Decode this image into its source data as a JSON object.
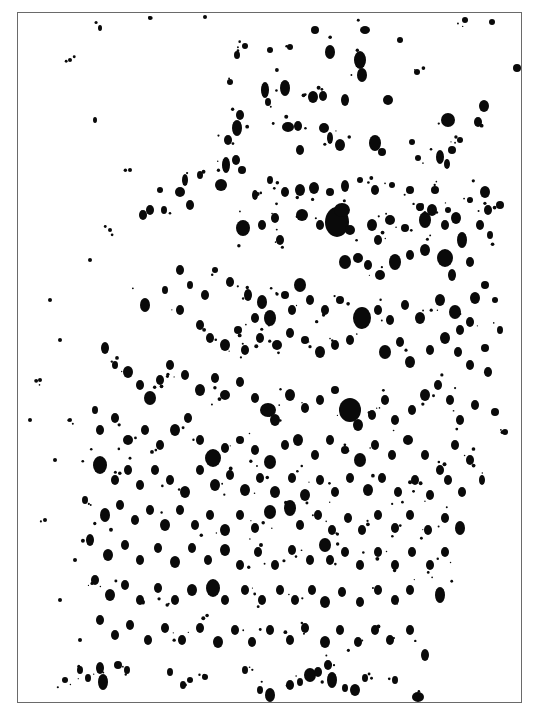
{
  "image": {
    "description": "Black ink splatter texture on white paper within a thin gray rectangular frame",
    "background_color": "#ffffff",
    "ink_color": "#0a0a0a",
    "frame_color": "#6a6a6a",
    "frame": {
      "x": 17,
      "y": 12,
      "width": 505,
      "height": 691
    }
  },
  "blobs": [
    [
      237,
      55,
      3,
      4
    ],
    [
      330,
      52,
      5,
      7
    ],
    [
      360,
      60,
      6,
      9
    ],
    [
      362,
      75,
      5,
      7
    ],
    [
      285,
      88,
      5,
      8
    ],
    [
      313,
      97,
      5,
      6
    ],
    [
      323,
      96,
      4,
      5
    ],
    [
      345,
      100,
      4,
      6
    ],
    [
      388,
      100,
      5,
      5
    ],
    [
      417,
      72,
      3,
      3
    ],
    [
      448,
      120,
      7,
      7
    ],
    [
      452,
      150,
      4,
      4
    ],
    [
      478,
      122,
      4,
      5
    ],
    [
      484,
      106,
      5,
      6
    ],
    [
      517,
      68,
      4,
      4
    ],
    [
      230,
      82,
      3,
      3
    ],
    [
      240,
      115,
      4,
      5
    ],
    [
      228,
      140,
      4,
      5
    ],
    [
      265,
      90,
      4,
      8
    ],
    [
      268,
      102,
      3,
      4
    ],
    [
      288,
      127,
      6,
      5
    ],
    [
      298,
      126,
      4,
      5
    ],
    [
      324,
      128,
      5,
      5
    ],
    [
      330,
      138,
      3,
      6
    ],
    [
      340,
      145,
      5,
      6
    ],
    [
      300,
      150,
      4,
      5
    ],
    [
      375,
      143,
      6,
      8
    ],
    [
      382,
      152,
      4,
      4
    ],
    [
      412,
      142,
      3,
      3
    ],
    [
      418,
      158,
      3,
      3
    ],
    [
      440,
      157,
      4,
      7
    ],
    [
      447,
      164,
      3,
      5
    ],
    [
      460,
      140,
      3,
      3
    ],
    [
      237,
      128,
      5,
      8
    ],
    [
      236,
      160,
      4,
      5
    ],
    [
      242,
      170,
      4,
      4
    ],
    [
      226,
      165,
      4,
      8
    ],
    [
      221,
      185,
      6,
      6
    ],
    [
      200,
      175,
      3,
      4
    ],
    [
      185,
      180,
      3,
      6
    ],
    [
      180,
      192,
      5,
      5
    ],
    [
      190,
      205,
      4,
      5
    ],
    [
      160,
      190,
      3,
      3
    ],
    [
      150,
      210,
      4,
      5
    ],
    [
      143,
      215,
      4,
      5
    ],
    [
      164,
      210,
      3,
      4
    ],
    [
      255,
      195,
      3,
      5
    ],
    [
      270,
      180,
      3,
      4
    ],
    [
      285,
      192,
      4,
      5
    ],
    [
      300,
      190,
      5,
      6
    ],
    [
      314,
      188,
      5,
      6
    ],
    [
      330,
      192,
      4,
      4
    ],
    [
      345,
      186,
      4,
      6
    ],
    [
      360,
      180,
      3,
      3
    ],
    [
      375,
      190,
      4,
      5
    ],
    [
      392,
      185,
      3,
      3
    ],
    [
      410,
      190,
      4,
      4
    ],
    [
      420,
      207,
      4,
      4
    ],
    [
      435,
      190,
      4,
      4
    ],
    [
      448,
      210,
      3,
      3
    ],
    [
      470,
      200,
      3,
      3
    ],
    [
      485,
      192,
      5,
      6
    ],
    [
      488,
      210,
      4,
      5
    ],
    [
      500,
      205,
      4,
      4
    ],
    [
      243,
      228,
      7,
      8
    ],
    [
      262,
      225,
      4,
      5
    ],
    [
      275,
      218,
      4,
      5
    ],
    [
      280,
      240,
      4,
      5
    ],
    [
      302,
      215,
      6,
      6
    ],
    [
      320,
      225,
      4,
      5
    ],
    [
      337,
      222,
      12,
      15
    ],
    [
      342,
      210,
      8,
      7
    ],
    [
      350,
      230,
      5,
      5
    ],
    [
      372,
      225,
      5,
      6
    ],
    [
      378,
      240,
      4,
      5
    ],
    [
      390,
      220,
      5,
      5
    ],
    [
      405,
      228,
      4,
      4
    ],
    [
      425,
      220,
      6,
      8
    ],
    [
      432,
      210,
      5,
      6
    ],
    [
      445,
      225,
      4,
      5
    ],
    [
      456,
      218,
      5,
      6
    ],
    [
      462,
      240,
      5,
      8
    ],
    [
      480,
      225,
      4,
      5
    ],
    [
      490,
      235,
      3,
      4
    ],
    [
      345,
      262,
      6,
      7
    ],
    [
      358,
      258,
      5,
      5
    ],
    [
      368,
      265,
      4,
      5
    ],
    [
      380,
      275,
      5,
      5
    ],
    [
      395,
      262,
      6,
      8
    ],
    [
      410,
      255,
      4,
      5
    ],
    [
      425,
      250,
      5,
      6
    ],
    [
      445,
      258,
      8,
      9
    ],
    [
      452,
      275,
      4,
      6
    ],
    [
      470,
      262,
      4,
      5
    ],
    [
      485,
      285,
      4,
      4
    ],
    [
      475,
      298,
      5,
      6
    ],
    [
      495,
      300,
      3,
      3
    ],
    [
      500,
      330,
      3,
      4
    ],
    [
      485,
      348,
      4,
      4
    ],
    [
      180,
      270,
      4,
      5
    ],
    [
      190,
      285,
      3,
      4
    ],
    [
      205,
      295,
      4,
      5
    ],
    [
      215,
      270,
      3,
      3
    ],
    [
      230,
      282,
      4,
      5
    ],
    [
      248,
      295,
      4,
      6
    ],
    [
      262,
      302,
      5,
      7
    ],
    [
      270,
      318,
      6,
      8
    ],
    [
      255,
      318,
      4,
      5
    ],
    [
      285,
      295,
      4,
      4
    ],
    [
      300,
      285,
      6,
      7
    ],
    [
      292,
      310,
      4,
      5
    ],
    [
      310,
      300,
      4,
      5
    ],
    [
      325,
      310,
      4,
      5
    ],
    [
      340,
      300,
      4,
      4
    ],
    [
      362,
      318,
      9,
      11
    ],
    [
      378,
      310,
      4,
      5
    ],
    [
      390,
      320,
      4,
      5
    ],
    [
      405,
      305,
      4,
      5
    ],
    [
      420,
      318,
      5,
      6
    ],
    [
      440,
      300,
      5,
      6
    ],
    [
      455,
      312,
      6,
      7
    ],
    [
      460,
      330,
      4,
      5
    ],
    [
      470,
      322,
      4,
      5
    ],
    [
      145,
      305,
      5,
      7
    ],
    [
      165,
      290,
      3,
      4
    ],
    [
      180,
      310,
      4,
      5
    ],
    [
      200,
      325,
      4,
      5
    ],
    [
      210,
      338,
      4,
      5
    ],
    [
      225,
      345,
      5,
      6
    ],
    [
      238,
      330,
      4,
      4
    ],
    [
      245,
      350,
      4,
      5
    ],
    [
      260,
      338,
      4,
      5
    ],
    [
      277,
      345,
      5,
      5
    ],
    [
      290,
      333,
      4,
      5
    ],
    [
      305,
      340,
      4,
      4
    ],
    [
      320,
      352,
      5,
      6
    ],
    [
      335,
      345,
      4,
      5
    ],
    [
      350,
      340,
      4,
      5
    ],
    [
      385,
      352,
      6,
      7
    ],
    [
      400,
      342,
      4,
      5
    ],
    [
      410,
      362,
      5,
      6
    ],
    [
      430,
      350,
      4,
      5
    ],
    [
      445,
      338,
      5,
      6
    ],
    [
      458,
      352,
      4,
      5
    ],
    [
      470,
      365,
      4,
      5
    ],
    [
      488,
      372,
      4,
      5
    ],
    [
      105,
      348,
      4,
      6
    ],
    [
      115,
      365,
      3,
      4
    ],
    [
      128,
      372,
      5,
      6
    ],
    [
      140,
      385,
      4,
      5
    ],
    [
      150,
      398,
      6,
      7
    ],
    [
      160,
      380,
      4,
      5
    ],
    [
      170,
      365,
      4,
      5
    ],
    [
      185,
      375,
      4,
      5
    ],
    [
      200,
      390,
      5,
      6
    ],
    [
      215,
      378,
      4,
      5
    ],
    [
      225,
      395,
      5,
      5
    ],
    [
      240,
      382,
      4,
      5
    ],
    [
      255,
      398,
      4,
      5
    ],
    [
      268,
      410,
      8,
      7
    ],
    [
      275,
      420,
      5,
      6
    ],
    [
      290,
      395,
      5,
      6
    ],
    [
      305,
      408,
      4,
      5
    ],
    [
      320,
      400,
      4,
      5
    ],
    [
      335,
      390,
      4,
      4
    ],
    [
      350,
      410,
      11,
      12
    ],
    [
      358,
      425,
      5,
      6
    ],
    [
      372,
      415,
      4,
      5
    ],
    [
      385,
      400,
      4,
      5
    ],
    [
      395,
      420,
      4,
      5
    ],
    [
      412,
      410,
      4,
      5
    ],
    [
      425,
      395,
      5,
      6
    ],
    [
      438,
      385,
      4,
      5
    ],
    [
      450,
      400,
      4,
      5
    ],
    [
      460,
      420,
      4,
      5
    ],
    [
      475,
      405,
      4,
      5
    ],
    [
      495,
      412,
      4,
      4
    ],
    [
      95,
      410,
      3,
      4
    ],
    [
      100,
      430,
      4,
      5
    ],
    [
      115,
      418,
      4,
      5
    ],
    [
      128,
      440,
      5,
      5
    ],
    [
      145,
      430,
      4,
      5
    ],
    [
      160,
      445,
      4,
      5
    ],
    [
      175,
      430,
      5,
      6
    ],
    [
      188,
      418,
      4,
      5
    ],
    [
      200,
      440,
      4,
      5
    ],
    [
      213,
      458,
      8,
      9
    ],
    [
      225,
      448,
      4,
      5
    ],
    [
      240,
      440,
      4,
      4
    ],
    [
      255,
      450,
      4,
      5
    ],
    [
      270,
      462,
      6,
      7
    ],
    [
      285,
      445,
      4,
      5
    ],
    [
      298,
      440,
      5,
      6
    ],
    [
      315,
      455,
      4,
      5
    ],
    [
      330,
      440,
      4,
      5
    ],
    [
      345,
      450,
      4,
      4
    ],
    [
      360,
      460,
      6,
      7
    ],
    [
      375,
      445,
      4,
      5
    ],
    [
      392,
      455,
      4,
      5
    ],
    [
      408,
      440,
      5,
      5
    ],
    [
      425,
      455,
      4,
      5
    ],
    [
      440,
      470,
      4,
      5
    ],
    [
      455,
      445,
      4,
      5
    ],
    [
      470,
      460,
      4,
      5
    ],
    [
      482,
      480,
      3,
      5
    ],
    [
      505,
      432,
      3,
      3
    ],
    [
      100,
      465,
      7,
      9
    ],
    [
      115,
      480,
      4,
      5
    ],
    [
      128,
      470,
      4,
      5
    ],
    [
      140,
      485,
      4,
      5
    ],
    [
      155,
      470,
      4,
      5
    ],
    [
      170,
      480,
      4,
      5
    ],
    [
      185,
      492,
      5,
      6
    ],
    [
      200,
      470,
      4,
      5
    ],
    [
      215,
      485,
      5,
      6
    ],
    [
      230,
      475,
      4,
      5
    ],
    [
      245,
      490,
      5,
      6
    ],
    [
      260,
      478,
      4,
      5
    ],
    [
      275,
      492,
      5,
      6
    ],
    [
      292,
      478,
      4,
      5
    ],
    [
      305,
      495,
      5,
      6
    ],
    [
      320,
      480,
      4,
      5
    ],
    [
      335,
      492,
      4,
      5
    ],
    [
      350,
      478,
      4,
      5
    ],
    [
      368,
      490,
      5,
      6
    ],
    [
      382,
      478,
      4,
      5
    ],
    [
      398,
      492,
      4,
      5
    ],
    [
      415,
      480,
      4,
      5
    ],
    [
      430,
      495,
      4,
      5
    ],
    [
      448,
      480,
      4,
      5
    ],
    [
      462,
      492,
      4,
      5
    ],
    [
      85,
      500,
      3,
      4
    ],
    [
      105,
      515,
      5,
      7
    ],
    [
      120,
      505,
      4,
      5
    ],
    [
      135,
      520,
      4,
      5
    ],
    [
      150,
      510,
      4,
      5
    ],
    [
      165,
      525,
      5,
      6
    ],
    [
      180,
      510,
      4,
      5
    ],
    [
      195,
      525,
      4,
      5
    ],
    [
      210,
      515,
      4,
      5
    ],
    [
      225,
      530,
      5,
      6
    ],
    [
      240,
      515,
      4,
      5
    ],
    [
      255,
      528,
      4,
      5
    ],
    [
      270,
      512,
      6,
      7
    ],
    [
      290,
      508,
      6,
      8
    ],
    [
      300,
      525,
      4,
      5
    ],
    [
      318,
      515,
      4,
      5
    ],
    [
      332,
      530,
      4,
      5
    ],
    [
      348,
      518,
      4,
      5
    ],
    [
      362,
      530,
      4,
      5
    ],
    [
      378,
      515,
      4,
      5
    ],
    [
      395,
      528,
      4,
      5
    ],
    [
      410,
      515,
      4,
      5
    ],
    [
      428,
      530,
      4,
      5
    ],
    [
      445,
      518,
      4,
      5
    ],
    [
      460,
      528,
      5,
      7
    ],
    [
      90,
      540,
      4,
      6
    ],
    [
      108,
      555,
      5,
      6
    ],
    [
      125,
      545,
      4,
      5
    ],
    [
      140,
      560,
      4,
      5
    ],
    [
      158,
      548,
      4,
      5
    ],
    [
      175,
      562,
      5,
      6
    ],
    [
      192,
      548,
      4,
      5
    ],
    [
      208,
      560,
      4,
      5
    ],
    [
      225,
      550,
      5,
      6
    ],
    [
      240,
      565,
      4,
      5
    ],
    [
      258,
      552,
      4,
      5
    ],
    [
      275,
      565,
      4,
      5
    ],
    [
      292,
      550,
      4,
      5
    ],
    [
      310,
      560,
      4,
      5
    ],
    [
      325,
      545,
      6,
      7
    ],
    [
      330,
      560,
      4,
      5
    ],
    [
      345,
      552,
      4,
      5
    ],
    [
      360,
      565,
      4,
      5
    ],
    [
      378,
      552,
      4,
      5
    ],
    [
      395,
      565,
      4,
      5
    ],
    [
      412,
      552,
      4,
      5
    ],
    [
      430,
      565,
      4,
      5
    ],
    [
      445,
      552,
      4,
      5
    ],
    [
      95,
      580,
      4,
      5
    ],
    [
      110,
      595,
      5,
      6
    ],
    [
      125,
      585,
      4,
      5
    ],
    [
      140,
      600,
      4,
      5
    ],
    [
      158,
      588,
      4,
      5
    ],
    [
      175,
      600,
      4,
      5
    ],
    [
      192,
      590,
      5,
      6
    ],
    [
      213,
      588,
      7,
      9
    ],
    [
      225,
      600,
      4,
      5
    ],
    [
      245,
      590,
      4,
      5
    ],
    [
      262,
      600,
      4,
      5
    ],
    [
      280,
      590,
      4,
      5
    ],
    [
      295,
      600,
      4,
      5
    ],
    [
      312,
      590,
      4,
      5
    ],
    [
      325,
      602,
      5,
      6
    ],
    [
      342,
      592,
      4,
      5
    ],
    [
      360,
      602,
      4,
      5
    ],
    [
      378,
      590,
      4,
      5
    ],
    [
      395,
      600,
      4,
      5
    ],
    [
      410,
      590,
      4,
      5
    ],
    [
      440,
      595,
      5,
      8
    ],
    [
      100,
      620,
      4,
      5
    ],
    [
      115,
      635,
      4,
      5
    ],
    [
      130,
      625,
      4,
      5
    ],
    [
      148,
      640,
      4,
      5
    ],
    [
      165,
      628,
      4,
      5
    ],
    [
      182,
      640,
      4,
      5
    ],
    [
      200,
      628,
      4,
      5
    ],
    [
      218,
      642,
      5,
      6
    ],
    [
      235,
      630,
      4,
      5
    ],
    [
      252,
      642,
      4,
      5
    ],
    [
      270,
      630,
      4,
      5
    ],
    [
      290,
      640,
      4,
      5
    ],
    [
      305,
      628,
      4,
      5
    ],
    [
      325,
      642,
      5,
      6
    ],
    [
      340,
      630,
      4,
      5
    ],
    [
      358,
      642,
      4,
      5
    ],
    [
      375,
      630,
      4,
      5
    ],
    [
      390,
      640,
      4,
      5
    ],
    [
      410,
      630,
      4,
      5
    ],
    [
      425,
      655,
      4,
      6
    ],
    [
      65,
      680,
      3,
      3
    ],
    [
      80,
      670,
      3,
      4
    ],
    [
      88,
      678,
      3,
      4
    ],
    [
      100,
      668,
      4,
      6
    ],
    [
      103,
      682,
      5,
      8
    ],
    [
      118,
      665,
      4,
      4
    ],
    [
      127,
      670,
      3,
      4
    ],
    [
      170,
      672,
      3,
      4
    ],
    [
      183,
      685,
      3,
      4
    ],
    [
      190,
      680,
      3,
      3
    ],
    [
      205,
      677,
      3,
      3
    ],
    [
      245,
      670,
      3,
      4
    ],
    [
      260,
      690,
      3,
      4
    ],
    [
      270,
      695,
      5,
      7
    ],
    [
      290,
      685,
      4,
      5
    ],
    [
      300,
      682,
      3,
      4
    ],
    [
      310,
      675,
      6,
      7
    ],
    [
      318,
      672,
      4,
      5
    ],
    [
      328,
      665,
      4,
      5
    ],
    [
      332,
      680,
      5,
      8
    ],
    [
      345,
      688,
      3,
      4
    ],
    [
      355,
      690,
      5,
      6
    ],
    [
      365,
      678,
      3,
      4
    ],
    [
      395,
      680,
      3,
      4
    ],
    [
      418,
      697,
      6,
      5
    ],
    [
      50,
      300,
      2,
      2
    ],
    [
      60,
      340,
      2,
      2
    ],
    [
      40,
      380,
      2,
      2
    ],
    [
      70,
      420,
      2,
      2
    ],
    [
      55,
      460,
      2,
      2
    ],
    [
      45,
      520,
      2,
      2
    ],
    [
      75,
      560,
      2,
      2
    ],
    [
      60,
      600,
      2,
      2
    ],
    [
      80,
      640,
      2,
      2
    ],
    [
      30,
      420,
      2,
      2
    ],
    [
      90,
      260,
      2,
      2
    ],
    [
      110,
      230,
      2,
      2
    ],
    [
      130,
      170,
      2,
      2
    ],
    [
      95,
      120,
      2,
      3
    ],
    [
      70,
      60,
      2,
      2
    ],
    [
      100,
      28,
      2,
      3
    ],
    [
      150,
      18,
      2,
      2
    ],
    [
      205,
      17,
      2,
      2
    ],
    [
      245,
      46,
      3,
      3
    ],
    [
      270,
      50,
      3,
      3
    ],
    [
      290,
      47,
      3,
      3
    ],
    [
      315,
      30,
      4,
      4
    ],
    [
      365,
      30,
      5,
      4
    ],
    [
      400,
      40,
      3,
      3
    ],
    [
      465,
      20,
      3,
      3
    ],
    [
      492,
      22,
      3,
      3
    ]
  ]
}
